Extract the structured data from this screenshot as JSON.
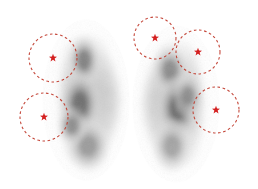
{
  "figure": {
    "width": 258,
    "height": 189,
    "background_color": "#ffffff"
  },
  "palette": {
    "marker_color": "#d42020",
    "circle_stroke": "#c0392b",
    "blob_dark": "#3a3a3a",
    "blob_mid": "#8c8c8c",
    "blob_light": "#d9d9d9",
    "background": "#ffffff"
  },
  "panels": [
    {
      "id": "panel-left",
      "name": "left-scan",
      "blob": {
        "cx": 86,
        "cy": 100,
        "rx": 30,
        "ry": 72
      },
      "hotspots": [
        {
          "cx": 84,
          "cy": 60,
          "rx": 13,
          "ry": 20,
          "intensity": 0.8
        },
        {
          "cx": 80,
          "cy": 104,
          "rx": 16,
          "ry": 26,
          "intensity": 0.92
        },
        {
          "cx": 88,
          "cy": 146,
          "rx": 18,
          "ry": 22,
          "intensity": 0.62
        },
        {
          "cx": 72,
          "cy": 126,
          "rx": 12,
          "ry": 16,
          "intensity": 0.7
        }
      ],
      "markers": [
        {
          "id": "L1",
          "label": "roi-1",
          "cx": 53,
          "cy": 58,
          "r": 24
        },
        {
          "id": "L2",
          "label": "roi-2",
          "cx": 44,
          "cy": 117,
          "r": 24
        }
      ]
    },
    {
      "id": "panel-right",
      "name": "right-scan",
      "blob": {
        "cx": 176,
        "cy": 104,
        "rx": 30,
        "ry": 70
      },
      "hotspots": [
        {
          "cx": 170,
          "cy": 70,
          "rx": 14,
          "ry": 20,
          "intensity": 0.72
        },
        {
          "cx": 178,
          "cy": 108,
          "rx": 17,
          "ry": 26,
          "intensity": 0.95
        },
        {
          "cx": 172,
          "cy": 146,
          "rx": 16,
          "ry": 22,
          "intensity": 0.55
        },
        {
          "cx": 188,
          "cy": 96,
          "rx": 12,
          "ry": 18,
          "intensity": 0.66
        }
      ],
      "markers": [
        {
          "id": "R1",
          "label": "roi-3",
          "cx": 155,
          "cy": 38,
          "r": 21
        },
        {
          "id": "R2",
          "label": "roi-4",
          "cx": 198,
          "cy": 52,
          "r": 22
        },
        {
          "id": "R3",
          "label": "roi-5",
          "cx": 216,
          "cy": 110,
          "r": 23
        }
      ]
    }
  ],
  "marker_style": {
    "circle_dash": "2.6 2.6",
    "circle_stroke_width": 1.1,
    "star_points": 5,
    "star_outer_radius": 4.2,
    "star_inner_radius": 1.75
  }
}
